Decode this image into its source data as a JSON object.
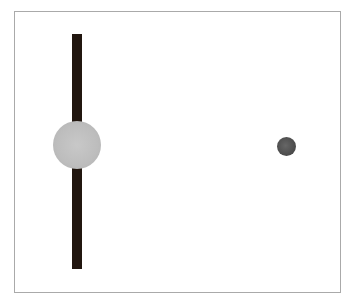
{
  "header": {
    "text": ""
  },
  "scene": {
    "bar": {
      "color": "#21160f",
      "orientation": "vertical"
    },
    "big_dot": {
      "color": "#bdbdbd",
      "label": ""
    },
    "small_dot": {
      "color": "#4a4a4a",
      "label": ""
    },
    "frame_border": "#aaaaaa"
  }
}
